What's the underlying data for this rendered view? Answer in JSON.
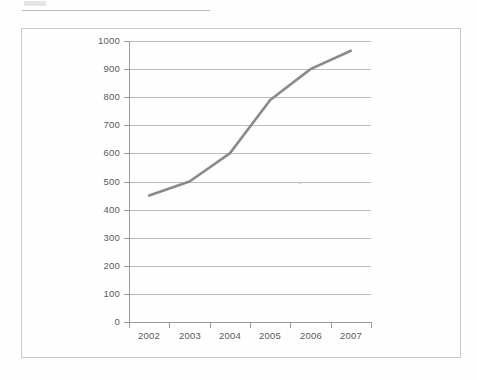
{
  "page": {
    "background_color": "#fefefe",
    "scan_artifacts": {
      "top_rule_label": "scan-rule",
      "smudge_label": "scan-smudge",
      "speck_label": "scan-speck"
    }
  },
  "figure": {
    "frame_color": "#c9c9c9",
    "axis_color": "#9a9a9a",
    "grid_color": "#bdbdbd",
    "tick_label_color": "#5a5a5a"
  },
  "chart_data": {
    "type": "line",
    "title": "",
    "subtitle": "",
    "xlabel": "",
    "ylabel": "",
    "categories": [
      "2002",
      "2003",
      "2004",
      "2005",
      "2006",
      "2007"
    ],
    "x_tick_labels": [
      "2002",
      "2003",
      "2004",
      "2005",
      "2006",
      "2007"
    ],
    "y_tick_labels": [
      "1000",
      "900",
      "800",
      "700",
      "600",
      "500",
      "400",
      "300",
      "200",
      "100",
      "0"
    ],
    "y_ticks": [
      0,
      100,
      200,
      300,
      400,
      500,
      600,
      700,
      800,
      900,
      1000
    ],
    "ylim": [
      0,
      1000
    ],
    "grid": "horizontal",
    "legend": null,
    "legend_position": "none",
    "series": [
      {
        "name": "series-1",
        "color": "#8a8a8a",
        "line_width": 2.6,
        "markers": false,
        "values": [
          450,
          500,
          600,
          790,
          900,
          965
        ]
      }
    ],
    "annotations": []
  }
}
